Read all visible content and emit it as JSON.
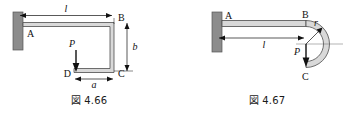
{
  "sheet": {
    "background": "#ffffff",
    "ink": "#111111",
    "wall_fill": "#8c8c8c",
    "member_fill": "#d9d9d9",
    "member_edge": "#4d4d4d",
    "thin_rule": "#666666"
  },
  "figures": [
    {
      "id": "fig-4-66",
      "caption": "図 4.66",
      "caption_prefix": "図",
      "caption_number": "4.66",
      "description": "Cantilever channel-shaped frame fixed at wall, load P applied at free end D",
      "labels": {
        "point_a": "A",
        "point_b": "B",
        "point_c": "C",
        "point_d": "D",
        "load": "P",
        "dim_length": "l",
        "dim_height": "b",
        "dim_width": "a"
      }
    },
    {
      "id": "fig-4-67",
      "caption": "図 4.67",
      "caption_prefix": "図",
      "caption_number": "4.67",
      "description": "Cantilever beam fixed at wall with semicircular curved end, load P applied downward",
      "labels": {
        "point_a": "A",
        "point_b": "B",
        "point_c": "C",
        "load": "P",
        "dim_length": "l",
        "dim_radius": "r"
      }
    }
  ]
}
